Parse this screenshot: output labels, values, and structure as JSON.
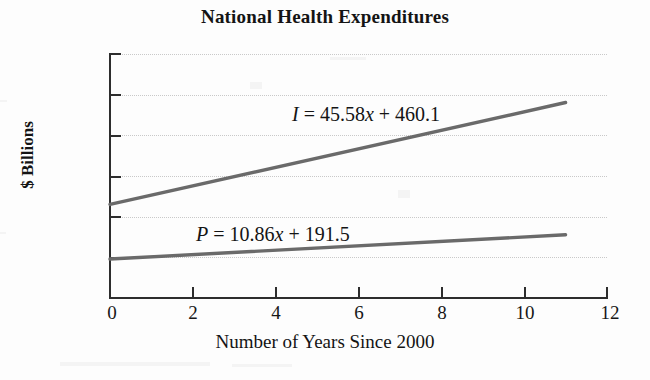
{
  "chart_data": {
    "type": "line",
    "title": "National Health Expenditures",
    "xlabel": "Number of Years Since 2000",
    "ylabel": "$ Billions",
    "xlim": [
      0,
      12
    ],
    "ylim": [
      0,
      1200
    ],
    "xticks": [
      0,
      2,
      4,
      6,
      8,
      10,
      12
    ],
    "yticks": [
      0,
      200,
      400,
      600,
      800,
      1000,
      1200
    ],
    "grid": "horizontal-dotted",
    "legend": "none",
    "series": [
      {
        "name": "I",
        "equation": "I = 45.58x + 460.1",
        "slope": 45.58,
        "intercept": 460.1,
        "x": [
          0,
          11
        ],
        "values": [
          460.1,
          961.48
        ],
        "color": "#6a6a6a"
      },
      {
        "name": "P",
        "equation": "P = 10.86x + 191.5",
        "slope": 10.86,
        "intercept": 191.5,
        "x": [
          0,
          11
        ],
        "values": [
          191.5,
          310.96
        ],
        "color": "#6a6a6a"
      }
    ],
    "annotations": [
      {
        "id": "equation-I",
        "symbol": "I",
        "rest": " = 45.58",
        "xvar": "x",
        "tail": " + 460.1"
      },
      {
        "id": "equation-P",
        "symbol": "P",
        "rest": " = 10.86",
        "xvar": "x",
        "tail": " + 191.5"
      }
    ]
  },
  "axis": {
    "y_labels": [
      "1200",
      "1000",
      "800",
      "600",
      "400",
      "200",
      "0"
    ],
    "x_labels": [
      "0",
      "2",
      "4",
      "6",
      "8",
      "10",
      "12"
    ]
  },
  "colors": {
    "line": "#6a6a6a",
    "axis": "#2d2d2d",
    "grid": "#c9c9c9",
    "text": "#141414",
    "background": "#fdfdfd"
  }
}
